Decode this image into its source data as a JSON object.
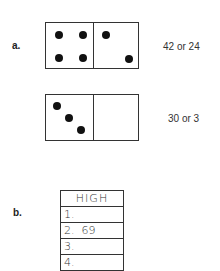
{
  "parts": {
    "a": {
      "label": "a.",
      "dominoes": [
        {
          "left_pips": 4,
          "right_pips": 2,
          "answer": "42 or 24"
        },
        {
          "left_pips": 3,
          "right_pips": 0,
          "answer": "30 or 3"
        }
      ]
    },
    "b": {
      "label": "b.",
      "table": {
        "header": "HIGH",
        "rows": [
          "1.",
          "2.  69",
          "3.",
          "4."
        ]
      }
    }
  }
}
